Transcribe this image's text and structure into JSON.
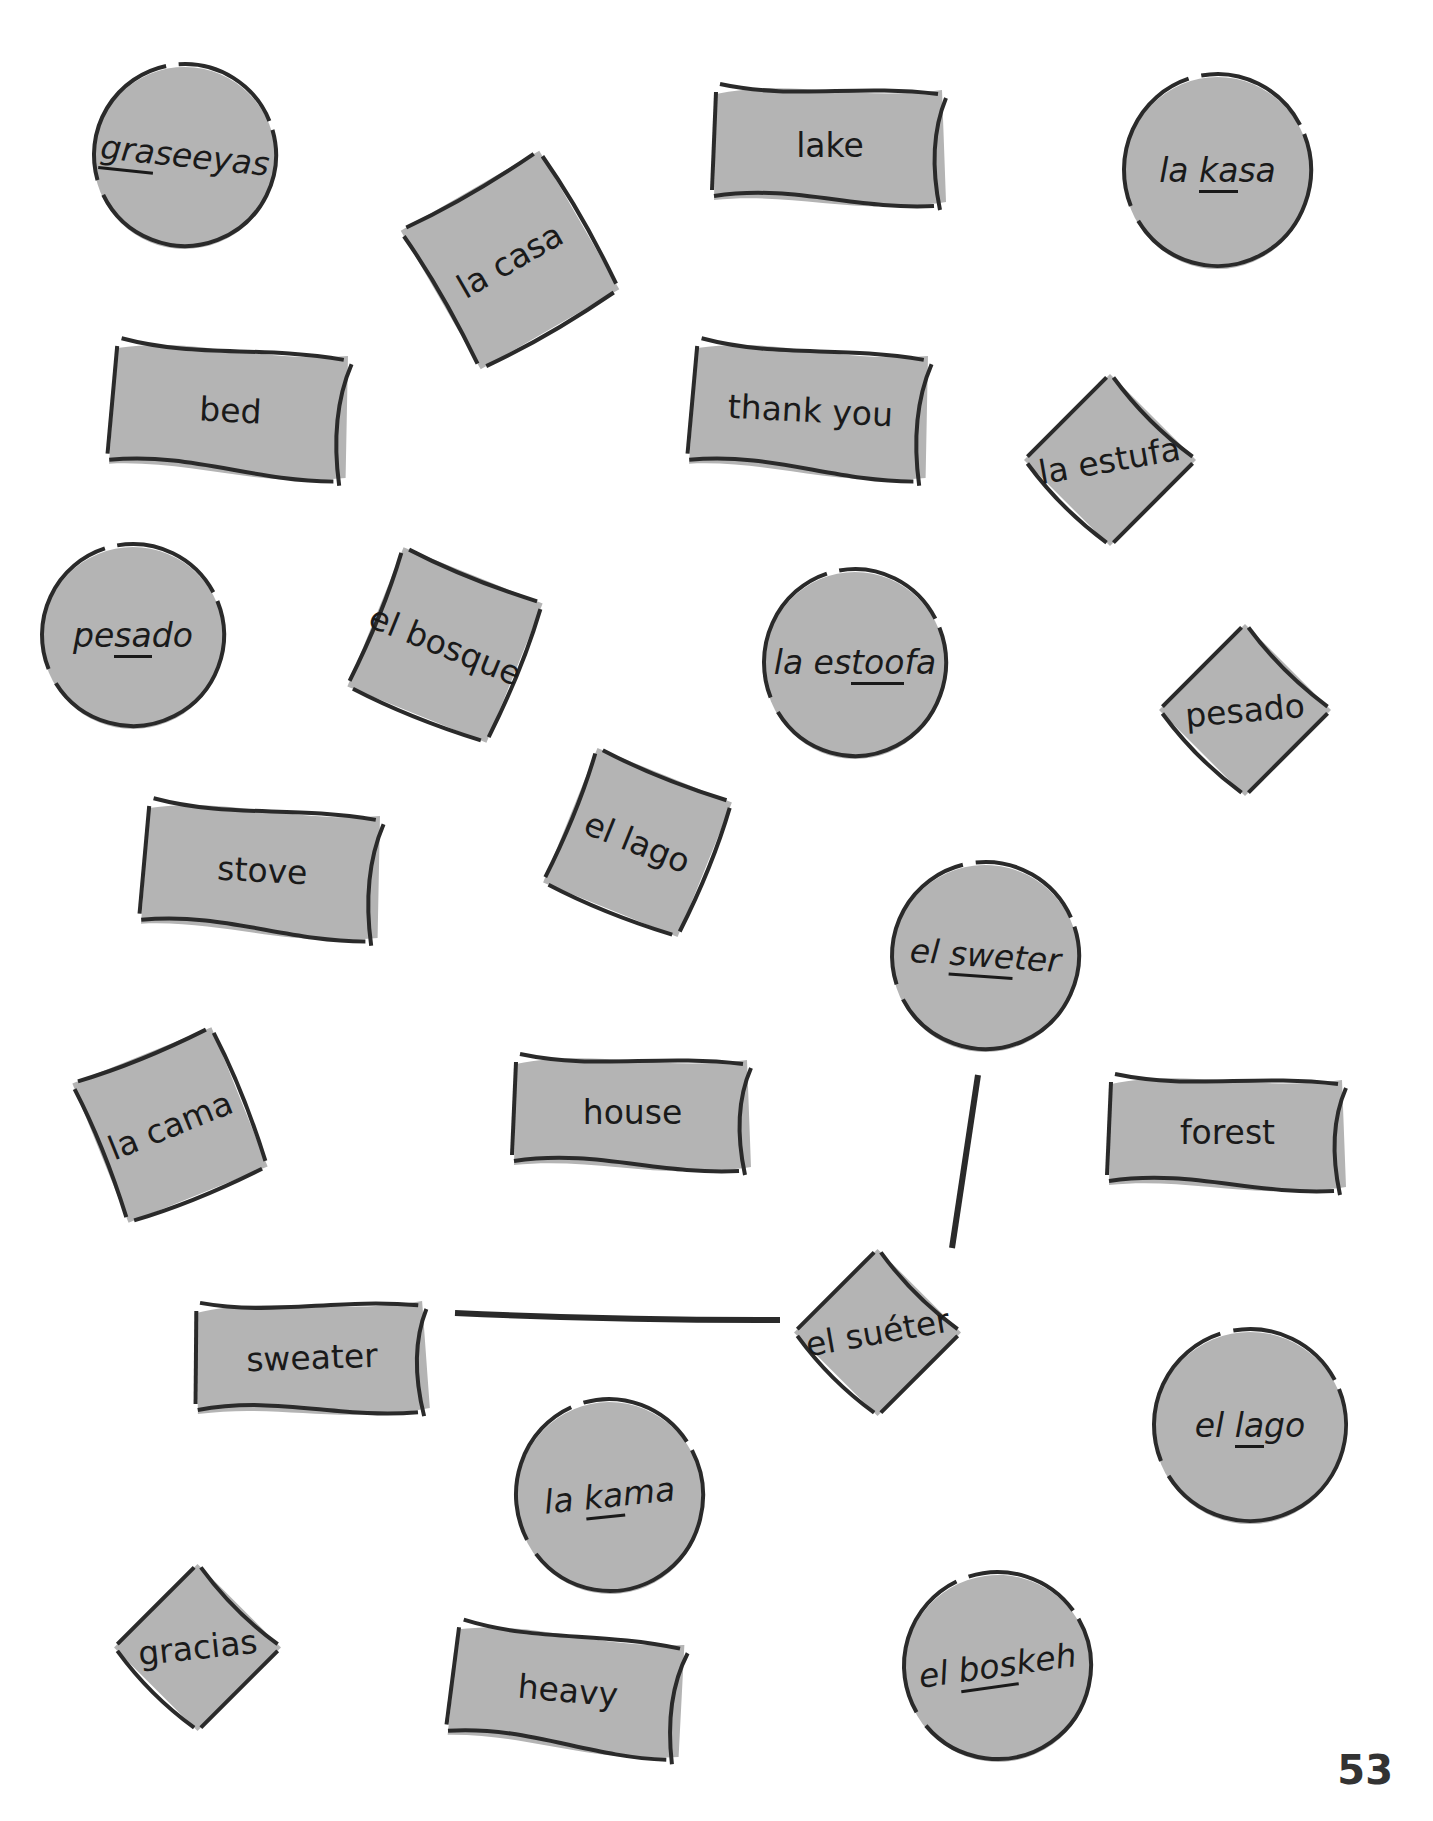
{
  "page": {
    "page_number": "53",
    "colors": {
      "card_fill": "#b4b4b4",
      "outline": "#2a2a2a",
      "text": "#1a1a1a",
      "background": "#ffffff"
    }
  },
  "cards": [
    {
      "id": "c1",
      "type": "circle",
      "kind": "pronunciation",
      "pre": "",
      "stress": "gra",
      "post": "seeyas",
      "full": "graseeyas",
      "x": 90,
      "y": 60,
      "w": 190,
      "h": 190,
      "rot": 6
    },
    {
      "id": "c2",
      "type": "square",
      "kind": "spanish",
      "text": "la casa",
      "x": 420,
      "y": 170,
      "w": 180,
      "h": 180,
      "rot": -30
    },
    {
      "id": "c3",
      "type": "rect",
      "kind": "english",
      "text": "lake",
      "x": 710,
      "y": 80,
      "w": 240,
      "h": 130,
      "rot": 0
    },
    {
      "id": "c4",
      "type": "circle",
      "kind": "pronunciation",
      "pre": "la ",
      "stress": "ka",
      "post": "sa",
      "full": "la kasa",
      "x": 1120,
      "y": 70,
      "w": 195,
      "h": 200,
      "rot": 0
    },
    {
      "id": "c5",
      "type": "rect",
      "kind": "english",
      "text": "bed",
      "x": 108,
      "y": 340,
      "w": 245,
      "h": 140,
      "rot": 3
    },
    {
      "id": "c6",
      "type": "rect",
      "kind": "english",
      "text": "thank you",
      "x": 688,
      "y": 340,
      "w": 245,
      "h": 140,
      "rot": 3
    },
    {
      "id": "c7",
      "type": "diamond",
      "kind": "spanish",
      "text": "la estufa",
      "x": 1020,
      "y": 370,
      "w": 180,
      "h": 180,
      "rot": -10
    },
    {
      "id": "c8",
      "type": "circle",
      "kind": "pronunciation",
      "pre": "pe",
      "stress": "sa",
      "post": "do",
      "full": "pesado",
      "x": 38,
      "y": 540,
      "w": 190,
      "h": 190,
      "rot": 0
    },
    {
      "id": "c9",
      "type": "square",
      "kind": "spanish",
      "text": "el bosque",
      "x": 360,
      "y": 560,
      "w": 170,
      "h": 170,
      "rot": 22
    },
    {
      "id": "c10",
      "type": "circle",
      "kind": "pronunciation",
      "pre": "la es",
      "stress": "too",
      "post": "fa",
      "full": "la estoofa",
      "x": 760,
      "y": 565,
      "w": 190,
      "h": 195,
      "rot": 0
    },
    {
      "id": "c11",
      "type": "diamond",
      "kind": "spanish",
      "text": "pesado",
      "x": 1155,
      "y": 620,
      "w": 180,
      "h": 180,
      "rot": -5
    },
    {
      "id": "c12",
      "type": "rect",
      "kind": "english",
      "text": "stove",
      "x": 140,
      "y": 800,
      "w": 245,
      "h": 140,
      "rot": 3
    },
    {
      "id": "c13",
      "type": "square",
      "kind": "spanish",
      "text": "el lago",
      "x": 555,
      "y": 760,
      "w": 165,
      "h": 165,
      "rot": 22
    },
    {
      "id": "c14",
      "type": "circle",
      "kind": "pronunciation",
      "pre": "el ",
      "stress": "swe",
      "post": "ter",
      "full": "el sweter",
      "x": 888,
      "y": 858,
      "w": 195,
      "h": 195,
      "rot": 4
    },
    {
      "id": "c15",
      "type": "square",
      "kind": "spanish",
      "text": "la cama",
      "x": 85,
      "y": 1040,
      "w": 170,
      "h": 170,
      "rot": -22
    },
    {
      "id": "c16",
      "type": "rect",
      "kind": "english",
      "text": "house",
      "x": 510,
      "y": 1050,
      "w": 245,
      "h": 125,
      "rot": 0
    },
    {
      "id": "c17",
      "type": "rect",
      "kind": "english",
      "text": "forest",
      "x": 1105,
      "y": 1070,
      "w": 245,
      "h": 125,
      "rot": 0
    },
    {
      "id": "c18",
      "type": "rect",
      "kind": "english",
      "text": "sweater",
      "x": 192,
      "y": 1295,
      "w": 240,
      "h": 125,
      "rot": -2
    },
    {
      "id": "c19",
      "type": "diamond",
      "kind": "spanish",
      "text": "el suéter",
      "x": 790,
      "y": 1245,
      "w": 175,
      "h": 175,
      "rot": -10
    },
    {
      "id": "c20",
      "type": "circle",
      "kind": "pronunciation",
      "pre": "el ",
      "stress": "la",
      "post": "go",
      "full": "el lago",
      "x": 1150,
      "y": 1325,
      "w": 200,
      "h": 200,
      "rot": 0
    },
    {
      "id": "c21",
      "type": "circle",
      "kind": "pronunciation",
      "pre": "la ",
      "stress": "ka",
      "post": "ma",
      "full": "la kama",
      "x": 512,
      "y": 1395,
      "w": 195,
      "h": 200,
      "rot": -6
    },
    {
      "id": "c22",
      "type": "diamond",
      "kind": "spanish",
      "text": "gracias",
      "x": 110,
      "y": 1560,
      "w": 175,
      "h": 175,
      "rot": -6
    },
    {
      "id": "c23",
      "type": "rect",
      "kind": "english",
      "text": "heavy",
      "x": 448,
      "y": 1625,
      "w": 240,
      "h": 130,
      "rot": 5
    },
    {
      "id": "c24",
      "type": "circle",
      "kind": "pronunciation",
      "pre": "el ",
      "stress": "bos",
      "post": "keh",
      "full": "el boskeh",
      "x": 900,
      "y": 1568,
      "w": 195,
      "h": 195,
      "rot": -8
    }
  ],
  "connectors": [
    {
      "from": "sweater",
      "to": "el suéter",
      "x1": 455,
      "y1": 1313,
      "x2": 780,
      "y2": 1320
    },
    {
      "from": "el sweter",
      "to": "el suéter",
      "x1": 978,
      "y1": 1075,
      "x2": 952,
      "y2": 1248
    }
  ]
}
